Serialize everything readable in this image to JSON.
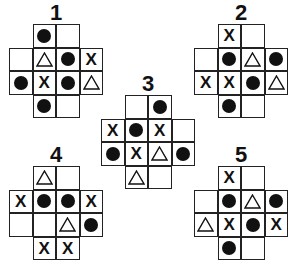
{
  "legend": {
    "dot": "filled-circle",
    "x": "X",
    "tri": "triangle",
    "empty": ""
  },
  "puzzles": [
    {
      "label": "1",
      "pos": {
        "x": 9,
        "y": 2
      },
      "rows": [
        [
          "",
          "dot",
          "empty",
          ""
        ],
        [
          "empty",
          "tri",
          "dot",
          "x"
        ],
        [
          "dot",
          "x",
          "dot",
          "tri"
        ],
        [
          "",
          "dot",
          "empty",
          ""
        ]
      ]
    },
    {
      "label": "2",
      "pos": {
        "x": 194,
        "y": 2
      },
      "rows": [
        [
          "",
          "x",
          "empty",
          ""
        ],
        [
          "empty",
          "dot",
          "tri",
          "dot"
        ],
        [
          "x",
          "x",
          "dot",
          "tri"
        ],
        [
          "",
          "dot",
          "empty",
          ""
        ]
      ]
    },
    {
      "label": "3",
      "pos": {
        "x": 101,
        "y": 73
      },
      "rows": [
        [
          "",
          "empty",
          "dot",
          ""
        ],
        [
          "x",
          "dot",
          "x",
          "empty"
        ],
        [
          "dot",
          "x",
          "tri",
          "dot"
        ],
        [
          "",
          "tri",
          "empty",
          ""
        ]
      ]
    },
    {
      "label": "4",
      "pos": {
        "x": 9,
        "y": 144
      },
      "rows": [
        [
          "",
          "tri",
          "empty",
          ""
        ],
        [
          "x",
          "dot",
          "dot",
          "x"
        ],
        [
          "empty",
          "empty",
          "tri",
          "dot"
        ],
        [
          "",
          "x",
          "x",
          ""
        ]
      ]
    },
    {
      "label": "5",
      "pos": {
        "x": 194,
        "y": 144
      },
      "rows": [
        [
          "",
          "x",
          "empty",
          ""
        ],
        [
          "empty",
          "dot",
          "tri",
          "dot"
        ],
        [
          "tri",
          "x",
          "dot",
          "x"
        ],
        [
          "",
          "dot",
          "empty",
          ""
        ]
      ]
    }
  ]
}
